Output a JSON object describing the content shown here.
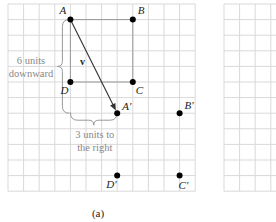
{
  "figure": {
    "caption": "(a)",
    "grid_left": {
      "x": 8,
      "y": 4,
      "cols": 12,
      "rows": 12,
      "cell": 15.6,
      "line_color": "#d9d9d9"
    },
    "grid_right": {
      "x": 224,
      "y": 4,
      "cols": 4,
      "rows": 12,
      "cell": 15.6,
      "line_color": "#d9d9d9"
    },
    "points": [
      {
        "id": "A",
        "label": "A",
        "col": 4,
        "row": 1
      },
      {
        "id": "B",
        "label": "B",
        "col": 8,
        "row": 1
      },
      {
        "id": "C",
        "label": "C",
        "col": 8,
        "row": 5
      },
      {
        "id": "D",
        "label": "D",
        "col": 4,
        "row": 5
      },
      {
        "id": "A1",
        "label": "A′",
        "col": 7,
        "row": 7
      },
      {
        "id": "B1",
        "label": "B′",
        "col": 11,
        "row": 7
      },
      {
        "id": "C1",
        "label": "C′",
        "col": 11,
        "row": 11
      },
      {
        "id": "D1",
        "label": "D′",
        "col": 7,
        "row": 11
      }
    ],
    "vector_label": "v",
    "brace_vertical": {
      "line1": "6 units",
      "line2": "downward"
    },
    "brace_horizontal": {
      "line1": "3 units to",
      "line2": "the right"
    },
    "colors": {
      "point": "#000000",
      "square": "#999999",
      "vector": "#333333",
      "brace": "#999999",
      "annotation_text": "#888888"
    }
  }
}
